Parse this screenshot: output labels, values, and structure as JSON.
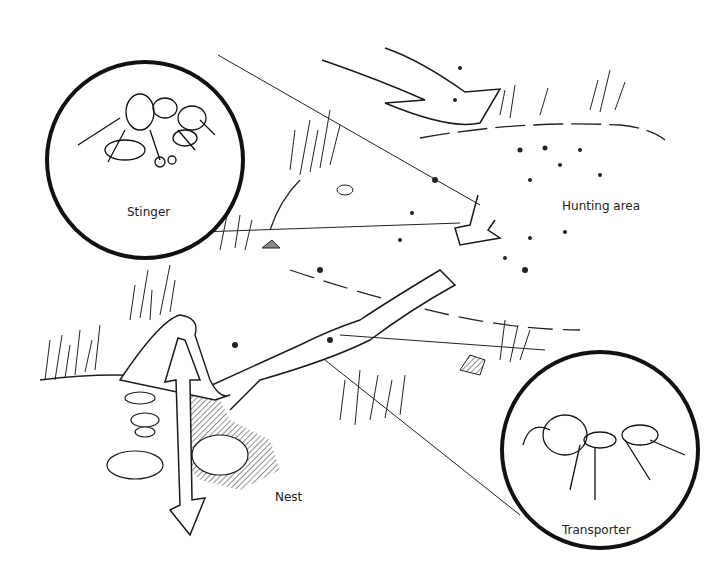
{
  "diagram": {
    "type": "illustration",
    "labels": {
      "stinger": "Stinger",
      "hunting_area": "Hunting area",
      "nest": "Nest",
      "transporter": "Transporter"
    },
    "insets": [
      {
        "label": "Stinger",
        "depicts": "ant stinging prey"
      },
      {
        "label": "Transporter",
        "depicts": "ant carrying prey"
      }
    ],
    "colors": {
      "ink": "#1a1a1a",
      "background": "#ffffff",
      "hatch": "#555555"
    }
  }
}
